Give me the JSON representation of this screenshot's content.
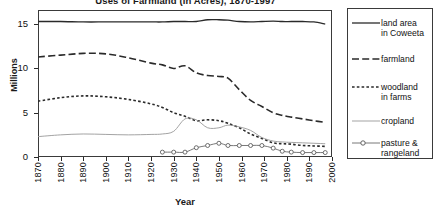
{
  "chart_data": {
    "type": "line",
    "title": "Uses of Farmland (in Acres), 1870-1997",
    "xlabel": "Year",
    "ylabel": "Millions",
    "xlim": [
      1870,
      2000
    ],
    "ylim": [
      0,
      16.6
    ],
    "yticks": [
      0,
      5,
      10,
      15
    ],
    "xticks": [
      1870,
      1880,
      1890,
      1900,
      1910,
      1920,
      1930,
      1940,
      1950,
      1960,
      1970,
      1980,
      1990,
      2000
    ],
    "grid": false,
    "legend_position": "right",
    "series": [
      {
        "name": "land area\nin Coweeta",
        "legend_label": "land area in Coweeta",
        "style": "solid",
        "color": "#2a2a2a",
        "x": [
          1870,
          1880,
          1890,
          1900,
          1910,
          1920,
          1925,
          1930,
          1935,
          1940,
          1945,
          1950,
          1954,
          1959,
          1964,
          1969,
          1974,
          1978,
          1982,
          1987,
          1992,
          1997
        ],
        "values": [
          15.3,
          15.3,
          15.25,
          15.25,
          15.25,
          15.25,
          15.25,
          15.3,
          15.3,
          15.3,
          15.5,
          15.5,
          15.45,
          15.3,
          15.25,
          15.3,
          15.35,
          15.3,
          15.3,
          15.3,
          15.25,
          15.0
        ]
      },
      {
        "name": "farmland",
        "legend_label": "farmland",
        "style": "long-dash",
        "color": "#2a2a2a",
        "x": [
          1870,
          1880,
          1890,
          1900,
          1910,
          1920,
          1925,
          1930,
          1935,
          1940,
          1945,
          1950,
          1954,
          1959,
          1964,
          1969,
          1974,
          1978,
          1982,
          1987,
          1992,
          1997
        ],
        "values": [
          11.3,
          11.5,
          11.7,
          11.65,
          11.2,
          10.6,
          10.4,
          10.0,
          10.3,
          9.5,
          9.2,
          9.1,
          8.9,
          7.6,
          6.4,
          5.7,
          5.0,
          4.7,
          4.5,
          4.3,
          4.1,
          3.9
        ]
      },
      {
        "name": "woodland\nin farms",
        "legend_label": "woodland in farms",
        "style": "short-dash",
        "color": "#2a2a2a",
        "x": [
          1870,
          1880,
          1890,
          1900,
          1910,
          1920,
          1925,
          1930,
          1935,
          1940,
          1945,
          1950,
          1954,
          1959,
          1964,
          1969,
          1974,
          1978,
          1982,
          1987,
          1992,
          1997
        ],
        "values": [
          6.3,
          6.7,
          6.9,
          6.8,
          6.5,
          6.0,
          5.6,
          5.0,
          4.6,
          4.1,
          4.2,
          4.1,
          3.8,
          3.3,
          2.6,
          2.1,
          1.6,
          1.5,
          1.45,
          1.3,
          1.25,
          1.2
        ]
      },
      {
        "name": "cropland",
        "legend_label": "cropland",
        "style": "thin-solid",
        "color": "#999999",
        "x": [
          1870,
          1880,
          1890,
          1900,
          1910,
          1920,
          1925,
          1930,
          1935,
          1940,
          1945,
          1950,
          1954,
          1959,
          1964,
          1969,
          1974,
          1978,
          1982,
          1987,
          1992,
          1997
        ],
        "values": [
          2.3,
          2.5,
          2.6,
          2.55,
          2.5,
          2.55,
          2.6,
          2.9,
          4.3,
          4.2,
          3.3,
          3.3,
          3.6,
          3.4,
          3.0,
          2.2,
          1.8,
          1.7,
          1.65,
          1.6,
          1.55,
          1.5
        ]
      },
      {
        "name": "pasture &\nrangeland",
        "legend_label": "pasture & rangeland",
        "style": "circle-line",
        "color": "#555555",
        "x": [
          1925,
          1930,
          1935,
          1940,
          1945,
          1950,
          1954,
          1959,
          1964,
          1969,
          1974,
          1978,
          1982,
          1987,
          1992,
          1997
        ],
        "values": [
          0.55,
          0.55,
          0.55,
          1.05,
          1.3,
          1.55,
          1.3,
          1.3,
          1.3,
          1.3,
          1.0,
          0.65,
          0.55,
          0.5,
          0.5,
          0.5
        ]
      }
    ]
  }
}
